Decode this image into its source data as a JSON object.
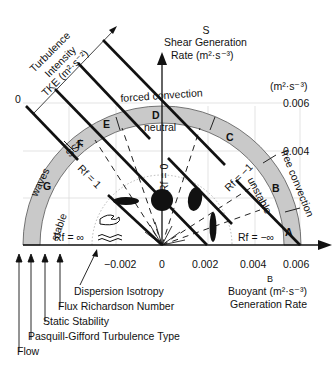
{
  "title": {
    "shear_symbol": "S",
    "shear_line1": "Shear Generation",
    "shear_line2": "Rate  (m²·s⁻³)",
    "buoyant_symbol": "B",
    "buoyant_line1": "Buoyant (m²·s⁻³)",
    "buoyant_line2": "Generation Rate",
    "y_unit": "(m²·s⁻³)",
    "tke_line1": "Turbulence",
    "tke_line2": "Intensity",
    "tke_line3": "TKE (m²·s⁻²)",
    "tke_zero": "0"
  },
  "axes": {
    "x_ticks": [
      "−0.002",
      "0",
      "0.002",
      "0.004",
      "0.006"
    ],
    "y_ticks": [
      "0.004",
      "0.006"
    ]
  },
  "pasquill_classes": [
    "A",
    "B",
    "C",
    "D",
    "E",
    "F",
    "G"
  ],
  "regime_labels": {
    "forced": "forced convection",
    "free": "free convection",
    "neutral": "neutral",
    "unstable": "unstable",
    "stable": "stable",
    "waves": "waves",
    "sst": "SST"
  },
  "richardson_labels": {
    "rf_zero": "Rf = 0",
    "rf_one": "Rf = 1",
    "rf_minus_one": "Rf = −1",
    "rf_inf": "Rf = ∞",
    "rf_minus_inf": "Rf = −∞"
  },
  "legend_arrows": [
    "Dispersion Isotropy",
    "Flux Richardson Number",
    "Static Stability",
    "Pasquill-Gifford Turbulence Type",
    "Flow"
  ],
  "colors": {
    "band": "#c8c8c8",
    "line": "#111111",
    "grid": "#d9d9d9"
  }
}
